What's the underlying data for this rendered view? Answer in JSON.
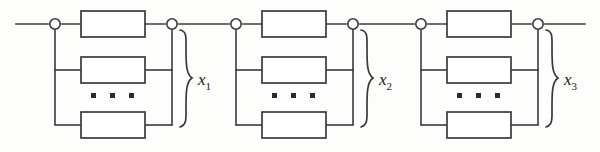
{
  "diagram": {
    "type": "reliability-block-diagram",
    "line_color": "#3a3a3a",
    "box_fill": "#ffffff",
    "dot_color": "#2b2b2b",
    "stages": [
      {
        "id": "stage-1",
        "label": "x",
        "subscript": "1",
        "label_full": "x1",
        "blocks": [
          "",
          "",
          ""
        ],
        "ellipsis": "▪ ▪ ▪",
        "ellipsis_count": 3,
        "left_node": "node",
        "right_node": "node"
      },
      {
        "id": "stage-2",
        "label": "x",
        "subscript": "2",
        "label_full": "x2",
        "blocks": [
          "",
          "",
          ""
        ],
        "ellipsis": "▪ ▪ ▪",
        "ellipsis_count": 3,
        "left_node": "node",
        "right_node": "node"
      },
      {
        "id": "stage-3",
        "label": "x",
        "subscript": "3",
        "label_full": "x3",
        "blocks": [
          "",
          "",
          ""
        ],
        "ellipsis": "▪ ▪ ▪",
        "ellipsis_count": 3,
        "left_node": "node",
        "right_node": "node"
      }
    ],
    "leads": {
      "input_lead": "",
      "output_lead": ""
    }
  }
}
